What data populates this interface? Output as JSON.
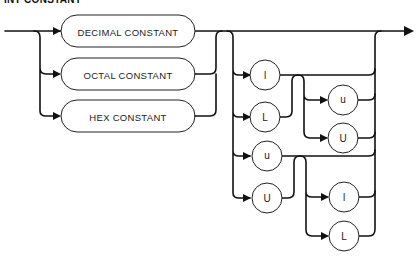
{
  "title": "INT CONSTANT",
  "nodes": {
    "decimal": "DECIMAL CONSTANT",
    "octal": "OCTAL CONSTANT",
    "hex": "HEX CONSTANT",
    "l_lower_1": "l",
    "L_upper_1": "L",
    "u_lower_1": "u",
    "U_upper_1": "U",
    "u_lower_2": "u",
    "U_upper_2": "U",
    "l_lower_2": "l",
    "L_upper_2": "L"
  }
}
